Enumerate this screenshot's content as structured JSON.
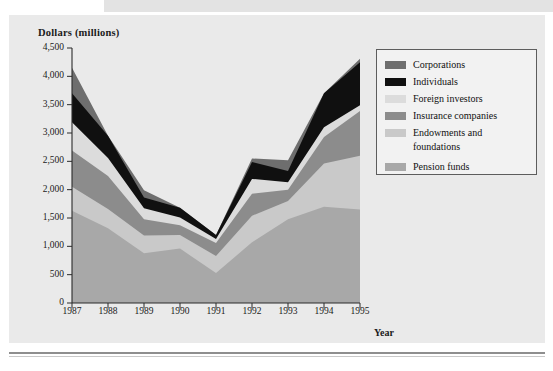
{
  "figure": {
    "y_axis_title": "Dollars (millions)",
    "x_axis_title": "Year"
  },
  "legend": {
    "items": [
      {
        "label": "Corporations",
        "color": "#6e6e6e",
        "swatch_name": "legend-swatch-corporations"
      },
      {
        "label": "Individuals",
        "color": "#101010",
        "swatch_name": "legend-swatch-individuals"
      },
      {
        "label": "Foreign investors",
        "color": "#dcdcdc",
        "swatch_name": "legend-swatch-foreign-investors"
      },
      {
        "label": "Insurance companies",
        "color": "#8c8c8c",
        "swatch_name": "legend-swatch-insurance-companies"
      },
      {
        "label": "Endowments and",
        "label_line2": "foundations",
        "color": "#c9c9c9",
        "swatch_name": "legend-swatch-endowments-and-foundations"
      },
      {
        "label": "Pension funds",
        "color": "#a8a8a8",
        "swatch_name": "legend-swatch-pension-funds"
      }
    ]
  },
  "chart_data": {
    "type": "area",
    "title": "",
    "subtitle": "",
    "xlabel": "Year",
    "ylabel": "Dollars (millions)",
    "stacked": true,
    "grid": false,
    "legend_position": "right",
    "xlim": [
      1987,
      1995
    ],
    "ylim": [
      0,
      4500
    ],
    "ytick_interval": 500,
    "categories": [
      1987,
      1988,
      1989,
      1990,
      1991,
      1992,
      1993,
      1994,
      1995
    ],
    "x_tick_labels": [
      "1987",
      "1988",
      "1989",
      "1990",
      "1991",
      "1992",
      "1993",
      "1994",
      "1995"
    ],
    "y_tick_labels": [
      "0",
      "500",
      "1,000",
      "1,500",
      "2,000",
      "2,500",
      "3,000",
      "3,500",
      "4,000",
      "4,500"
    ],
    "y_tick_values": [
      0,
      500,
      1000,
      1500,
      2000,
      2500,
      3000,
      3500,
      4000,
      4500
    ],
    "series": [
      {
        "name": "Pension funds",
        "color": "#a8a8a8",
        "values": [
          1630,
          1320,
          880,
          960,
          530,
          1070,
          1480,
          1700,
          1650
        ]
      },
      {
        "name": "Endowments and foundations",
        "color": "#c9c9c9",
        "values": [
          420,
          340,
          310,
          240,
          300,
          470,
          320,
          760,
          950
        ]
      },
      {
        "name": "Insurance companies",
        "color": "#8c8c8c",
        "values": [
          640,
          580,
          290,
          170,
          230,
          390,
          200,
          470,
          790
        ]
      },
      {
        "name": "Foreign investors",
        "color": "#dcdcdc",
        "values": [
          500,
          320,
          190,
          140,
          70,
          260,
          130,
          170,
          100
        ]
      },
      {
        "name": "Individuals",
        "color": "#101010",
        "values": [
          510,
          390,
          190,
          170,
          70,
          300,
          200,
          600,
          760
        ]
      },
      {
        "name": "Corporations",
        "color": "#6e6e6e",
        "values": [
          450,
          0,
          130,
          0,
          0,
          60,
          190,
          0,
          60
        ]
      }
    ],
    "stack_totals": [
      4150,
      2950,
      1990,
      1680,
      1200,
      2550,
      2520,
      3700,
      4310
    ]
  }
}
